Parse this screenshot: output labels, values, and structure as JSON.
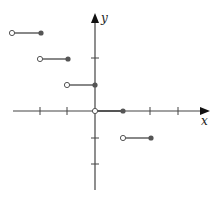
{
  "figure": {
    "type": "step-function-graph",
    "axes": {
      "x_label": "x",
      "y_label": "y",
      "x_ticks": [
        -3,
        -2,
        -1,
        1,
        2,
        3
      ],
      "y_ticks": [
        -2,
        -1,
        1,
        2
      ]
    },
    "segments": [
      {
        "y": 3,
        "open_x": -3,
        "closed_x": -2
      },
      {
        "y": 2,
        "open_x": -2,
        "closed_x": -1
      },
      {
        "y": 1,
        "open_x": -1,
        "closed_x": 0
      },
      {
        "y": 0,
        "open_x": 0,
        "closed_x": 1
      },
      {
        "y": -1,
        "open_x": 1,
        "closed_x": 2
      }
    ],
    "colors": {
      "axis": "#444444",
      "segment": "#555555",
      "closed_dot": "#555555",
      "open_dot_fill": "#ffffff"
    }
  }
}
